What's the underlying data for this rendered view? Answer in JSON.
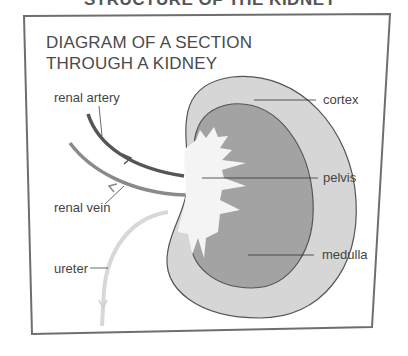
{
  "page_title_partial": "STRUCTURE OF THE KIDNEY",
  "heading": {
    "line1": "DIAGRAM OF A SECTION",
    "line2": "THROUGH A KIDNEY"
  },
  "labels": {
    "renal_artery": "renal artery",
    "renal_vein": "renal vein",
    "ureter": "ureter",
    "cortex": "cortex",
    "pelvis": "pelvis",
    "medulla": "medulla"
  },
  "colors": {
    "cortex": "#d6d6d6",
    "medulla": "#a3a3a3",
    "pelvis": "#f4f4f4",
    "artery": "#555555",
    "vein": "#8a8a8a",
    "ureter": "#d8d8d8",
    "frame": "#6e6e6e"
  }
}
